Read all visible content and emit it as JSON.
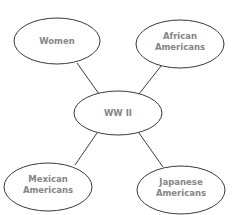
{
  "diagram": {
    "type": "web-organizer",
    "center": {
      "id": "center",
      "lines": [
        "WW II"
      ]
    },
    "nodes": [
      {
        "id": "women",
        "lines": [
          "Women"
        ]
      },
      {
        "id": "african-americans",
        "lines": [
          "African",
          "Americans"
        ]
      },
      {
        "id": "mexican-americans",
        "lines": [
          "Mexican",
          "Americans"
        ]
      },
      {
        "id": "japanese-americans",
        "lines": [
          "Japanese",
          "Americans"
        ]
      }
    ],
    "edges": [
      {
        "from": "center",
        "to": "women"
      },
      {
        "from": "center",
        "to": "african-americans"
      },
      {
        "from": "center",
        "to": "mexican-americans"
      },
      {
        "from": "center",
        "to": "japanese-americans"
      }
    ],
    "colors": {
      "stroke": "#3a3a3a",
      "text": "#858585",
      "fill": "#ffffff"
    }
  }
}
